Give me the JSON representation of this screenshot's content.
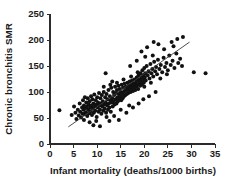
{
  "chart_data": {
    "type": "scatter",
    "title": "",
    "xlabel": "Infant mortality (deaths/1000 births)",
    "ylabel": "Chronic bronchitis SMR",
    "xlim": [
      0,
      35
    ],
    "ylim": [
      0,
      250
    ],
    "xticks": [
      0,
      5,
      10,
      15,
      20,
      25,
      30,
      35
    ],
    "yticks": [
      0,
      50,
      100,
      150,
      200,
      250
    ],
    "xtick_labels": [
      "0",
      "5",
      "10",
      "15",
      "20",
      "25",
      "30",
      "35"
    ],
    "ytick_labels": [
      "0",
      "50",
      "100",
      "150",
      "200",
      "250"
    ],
    "grid": false,
    "legend": false,
    "legend_position": "none",
    "marker": "filled-circle",
    "marker_size": 2.0,
    "marker_color": "#111111",
    "fit_line": {
      "name": "linear regression",
      "color": "#3a3a3a",
      "x_start": 3.9,
      "y_start": 33,
      "x_end": 29.6,
      "y_end": 196,
      "slope": 6.34,
      "intercept": 8.3
    },
    "points": [
      [
        2.0,
        65
      ],
      [
        4.6,
        56
      ],
      [
        5.1,
        72
      ],
      [
        5.4,
        60
      ],
      [
        5.6,
        48
      ],
      [
        5.9,
        66
      ],
      [
        6.1,
        55
      ],
      [
        6.3,
        78
      ],
      [
        6.4,
        62
      ],
      [
        6.6,
        51
      ],
      [
        6.8,
        70
      ],
      [
        6.9,
        58
      ],
      [
        7.0,
        84
      ],
      [
        7.1,
        66
      ],
      [
        7.2,
        74
      ],
      [
        7.3,
        57
      ],
      [
        7.4,
        90
      ],
      [
        7.5,
        69
      ],
      [
        7.6,
        61
      ],
      [
        7.7,
        80
      ],
      [
        7.8,
        72
      ],
      [
        7.9,
        54
      ],
      [
        8.0,
        88
      ],
      [
        8.1,
        66
      ],
      [
        8.2,
        76
      ],
      [
        8.3,
        59
      ],
      [
        8.4,
        82
      ],
      [
        8.5,
        70
      ],
      [
        8.6,
        63
      ],
      [
        8.7,
        92
      ],
      [
        8.8,
        74
      ],
      [
        8.9,
        56
      ],
      [
        9.0,
        86
      ],
      [
        9.1,
        68
      ],
      [
        9.2,
        78
      ],
      [
        9.3,
        60
      ],
      [
        9.4,
        95
      ],
      [
        9.5,
        72
      ],
      [
        9.6,
        64
      ],
      [
        9.7,
        84
      ],
      [
        9.8,
        76
      ],
      [
        9.9,
        52
      ],
      [
        10.0,
        90
      ],
      [
        10.1,
        70
      ],
      [
        10.2,
        80
      ],
      [
        10.3,
        62
      ],
      [
        10.4,
        98
      ],
      [
        10.5,
        74
      ],
      [
        10.6,
        66
      ],
      [
        10.7,
        88
      ],
      [
        10.8,
        78
      ],
      [
        10.9,
        58
      ],
      [
        11.0,
        94
      ],
      [
        11.1,
        72
      ],
      [
        11.2,
        82
      ],
      [
        11.3,
        64
      ],
      [
        11.4,
        100
      ],
      [
        11.5,
        76
      ],
      [
        11.6,
        68
      ],
      [
        11.7,
        90
      ],
      [
        11.8,
        80
      ],
      [
        11.9,
        60
      ],
      [
        12.0,
        96
      ],
      [
        12.1,
        74
      ],
      [
        12.2,
        86
      ],
      [
        12.3,
        66
      ],
      [
        12.4,
        104
      ],
      [
        12.5,
        78
      ],
      [
        12.6,
        70
      ],
      [
        12.7,
        92
      ],
      [
        12.8,
        84
      ],
      [
        12.9,
        62
      ],
      [
        13.0,
        108
      ],
      [
        13.1,
        80
      ],
      [
        13.2,
        88
      ],
      [
        13.3,
        72
      ],
      [
        13.4,
        100
      ],
      [
        13.5,
        82
      ],
      [
        13.6,
        94
      ],
      [
        13.7,
        76
      ],
      [
        13.8,
        110
      ],
      [
        13.9,
        86
      ],
      [
        14.0,
        98
      ],
      [
        14.1,
        78
      ],
      [
        14.2,
        104
      ],
      [
        14.3,
        90
      ],
      [
        14.4,
        82
      ],
      [
        14.5,
        112
      ],
      [
        14.6,
        96
      ],
      [
        14.7,
        86
      ],
      [
        14.8,
        106
      ],
      [
        14.9,
        92
      ],
      [
        15.0,
        100
      ],
      [
        15.1,
        84
      ],
      [
        15.2,
        114
      ],
      [
        15.3,
        96
      ],
      [
        15.4,
        88
      ],
      [
        15.5,
        108
      ],
      [
        15.6,
        100
      ],
      [
        15.7,
        92
      ],
      [
        15.8,
        116
      ],
      [
        15.9,
        102
      ],
      [
        16.0,
        94
      ],
      [
        16.1,
        110
      ],
      [
        16.2,
        104
      ],
      [
        16.3,
        96
      ],
      [
        16.4,
        118
      ],
      [
        16.5,
        106
      ],
      [
        16.6,
        98
      ],
      [
        16.7,
        112
      ],
      [
        16.8,
        102
      ],
      [
        16.9,
        120
      ],
      [
        17.0,
        108
      ],
      [
        17.1,
        100
      ],
      [
        17.2,
        114
      ],
      [
        17.3,
        106
      ],
      [
        17.4,
        122
      ],
      [
        17.5,
        110
      ],
      [
        17.6,
        102
      ],
      [
        17.7,
        116
      ],
      [
        17.8,
        108
      ],
      [
        17.9,
        124
      ],
      [
        18.0,
        112
      ],
      [
        18.1,
        104
      ],
      [
        18.2,
        118
      ],
      [
        18.3,
        110
      ],
      [
        18.4,
        128
      ],
      [
        18.5,
        114
      ],
      [
        18.6,
        122
      ],
      [
        18.7,
        106
      ],
      [
        18.8,
        132
      ],
      [
        18.9,
        116
      ],
      [
        19.0,
        124
      ],
      [
        19.1,
        112
      ],
      [
        19.2,
        136
      ],
      [
        19.3,
        120
      ],
      [
        19.4,
        128
      ],
      [
        19.5,
        114
      ],
      [
        19.6,
        142
      ],
      [
        19.7,
        124
      ],
      [
        19.8,
        132
      ],
      [
        19.9,
        118
      ],
      [
        20.0,
        146
      ],
      [
        20.1,
        128
      ],
      [
        20.2,
        136
      ],
      [
        20.3,
        122
      ],
      [
        20.5,
        150
      ],
      [
        20.7,
        132
      ],
      [
        20.9,
        140
      ],
      [
        21.1,
        126
      ],
      [
        21.3,
        154
      ],
      [
        21.5,
        136
      ],
      [
        21.7,
        144
      ],
      [
        21.9,
        130
      ],
      [
        22.1,
        158
      ],
      [
        22.3,
        140
      ],
      [
        22.5,
        148
      ],
      [
        22.7,
        134
      ],
      [
        22.9,
        162
      ],
      [
        23.2,
        144
      ],
      [
        23.5,
        152
      ],
      [
        23.8,
        138
      ],
      [
        24.1,
        166
      ],
      [
        24.4,
        148
      ],
      [
        24.7,
        156
      ],
      [
        25.0,
        142
      ],
      [
        25.3,
        170
      ],
      [
        25.6,
        152
      ],
      [
        26.0,
        160
      ],
      [
        26.4,
        146
      ],
      [
        26.8,
        174
      ],
      [
        27.2,
        156
      ],
      [
        27.6,
        164
      ],
      [
        28.0,
        150
      ],
      [
        11.8,
        136
      ],
      [
        13.2,
        120
      ],
      [
        14.6,
        46
      ],
      [
        10.6,
        34
      ],
      [
        9.2,
        36
      ],
      [
        12.6,
        44
      ],
      [
        16.2,
        60
      ],
      [
        17.6,
        70
      ],
      [
        18.8,
        78
      ],
      [
        19.8,
        86
      ],
      [
        21.0,
        92
      ],
      [
        22.4,
        100
      ],
      [
        19.4,
        178
      ],
      [
        20.6,
        186
      ],
      [
        21.8,
        170
      ],
      [
        23.0,
        192
      ],
      [
        24.2,
        182
      ],
      [
        25.8,
        196
      ],
      [
        27.0,
        202
      ],
      [
        28.2,
        206
      ],
      [
        26.2,
        188
      ],
      [
        22.0,
        196
      ],
      [
        20.2,
        168
      ],
      [
        18.4,
        160
      ],
      [
        17.0,
        150
      ],
      [
        30.5,
        138
      ],
      [
        33.0,
        136
      ],
      [
        8.4,
        42
      ],
      [
        9.8,
        44
      ],
      [
        7.2,
        46
      ],
      [
        12.0,
        52
      ],
      [
        13.6,
        54
      ],
      [
        15.0,
        66
      ],
      [
        16.8,
        74
      ],
      [
        11.4,
        110
      ],
      [
        12.8,
        114
      ],
      [
        14.2,
        118
      ],
      [
        15.6,
        124
      ],
      [
        17.2,
        130
      ],
      [
        18.6,
        138
      ],
      [
        20.0,
        110
      ],
      [
        21.4,
        118
      ],
      [
        23.4,
        126
      ],
      [
        24.8,
        134
      ]
    ]
  }
}
